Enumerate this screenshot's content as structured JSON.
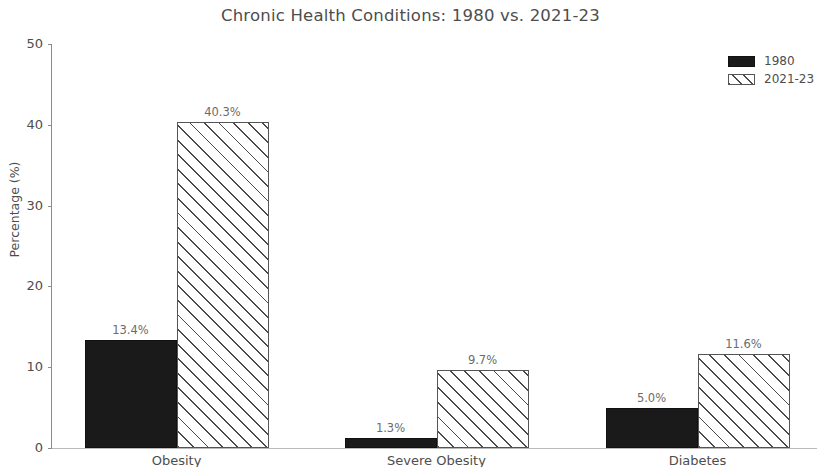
{
  "chart_data": {
    "type": "bar",
    "title": "Chronic Health Conditions: 1980 vs. 2021-23",
    "xlabel": "",
    "ylabel": "Percentage (%)",
    "ylim": [
      0,
      50
    ],
    "yticks": [
      0,
      10,
      20,
      30,
      40,
      50
    ],
    "ytick_labels": [
      "0",
      "10",
      "20",
      "30",
      "40",
      "50"
    ],
    "grid": false,
    "legend_position": "upper right",
    "categories": [
      "Obesity",
      "Severe Obesity",
      "Diabetes"
    ],
    "series": [
      {
        "name": "1980",
        "style": "solid-black",
        "color": "#1a1a1a",
        "values": [
          13.4,
          1.3,
          5.0
        ],
        "labels": [
          "13.4%",
          "1.3%",
          "5.0%"
        ]
      },
      {
        "name": "2021-23",
        "style": "white-diagonal-hatch",
        "color": "#ffffff",
        "edge_color": "#555555",
        "values": [
          40.3,
          9.7,
          11.6
        ],
        "labels": [
          "40.3%",
          "9.7%",
          "11.6%"
        ]
      }
    ]
  },
  "legend": {
    "entries": [
      {
        "label": "1980"
      },
      {
        "label": "2021-23"
      }
    ]
  }
}
